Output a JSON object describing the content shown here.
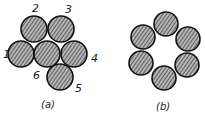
{
  "figure": {
    "panel_a": {
      "caption": "(a)",
      "description": "Six round strands in compact arrangement",
      "strands": [
        {
          "label": "1",
          "cx": 21,
          "cy": 54,
          "lx": 3,
          "ly": 58
        },
        {
          "label": "2",
          "cx": 34,
          "cy": 29,
          "lx": 32,
          "ly": 12
        },
        {
          "label": "3",
          "cx": 61,
          "cy": 29,
          "lx": 65,
          "ly": 13
        },
        {
          "label": "4",
          "cx": 74,
          "cy": 54,
          "lx": 91,
          "ly": 62
        },
        {
          "label": "5",
          "cx": 60,
          "cy": 77,
          "lx": 75,
          "ly": 92
        },
        {
          "label": "6",
          "cx": 47,
          "cy": 54,
          "lx": 33,
          "ly": 79
        }
      ],
      "radius": 13
    },
    "panel_b": {
      "caption": "(b)",
      "description": "Six round strands arranged in a ring with hollow center",
      "strands": [
        {
          "cx": 166,
          "cy": 24
        },
        {
          "cx": 188,
          "cy": 39
        },
        {
          "cx": 187,
          "cy": 65
        },
        {
          "cx": 164,
          "cy": 78
        },
        {
          "cx": 141,
          "cy": 63
        },
        {
          "cx": 143,
          "cy": 37
        }
      ],
      "radius": 12
    },
    "colors": {
      "strand_fill": "#8f8f8f",
      "strand_stroke": "#111111",
      "hatch": "#3a3a3a",
      "background": "#ffffff"
    }
  }
}
